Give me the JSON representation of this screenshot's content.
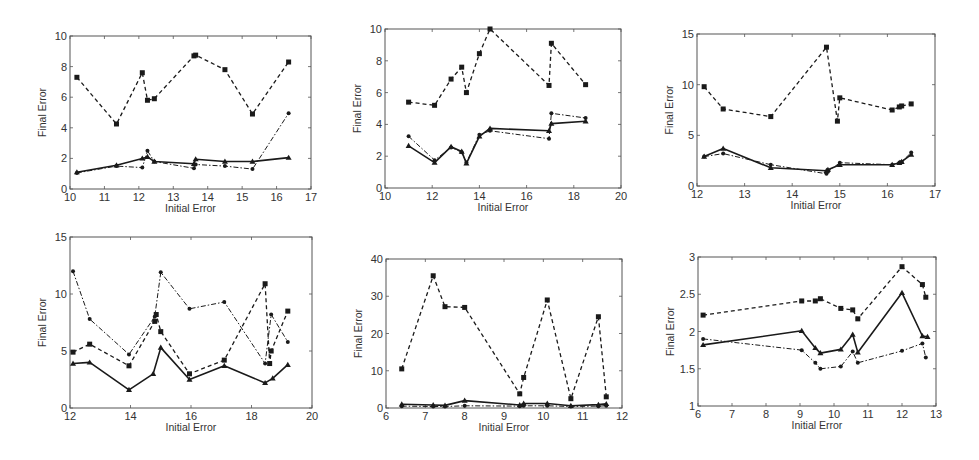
{
  "chart_data": [
    {
      "type": "line",
      "panel": "top-left",
      "title": "",
      "xlabel": "Initial Error",
      "ylabel": "Final Error",
      "xlim": [
        10,
        17
      ],
      "ylim": [
        0,
        10
      ],
      "xticks": [
        10,
        11,
        12,
        13,
        14,
        15,
        16,
        17
      ],
      "yticks": [
        0,
        2,
        4,
        6,
        8,
        10
      ],
      "grid": false,
      "box": {
        "left": 70,
        "top": 36,
        "right": 311,
        "bottom": 189
      },
      "series": [
        {
          "name": "dashed-squares",
          "style": "dashed",
          "marker": "square",
          "x": [
            10.2,
            11.35,
            12.1,
            12.25,
            12.45,
            13.6,
            13.65,
            14.5,
            15.3,
            16.35
          ],
          "y": [
            7.3,
            4.25,
            7.6,
            5.8,
            5.9,
            8.7,
            8.75,
            7.8,
            4.9,
            8.3
          ]
        },
        {
          "name": "solid-triangles",
          "style": "solid",
          "marker": "triangle",
          "x": [
            10.2,
            11.35,
            12.1,
            12.25,
            12.45,
            13.6,
            13.65,
            14.5,
            15.3,
            16.35
          ],
          "y": [
            1.1,
            1.55,
            2.0,
            2.1,
            1.8,
            1.65,
            1.95,
            1.8,
            1.8,
            2.05
          ]
        },
        {
          "name": "dashdot-dots",
          "style": "dashdot",
          "marker": "dot",
          "x": [
            10.2,
            11.35,
            12.1,
            12.25,
            12.45,
            13.6,
            13.65,
            14.5,
            15.3,
            16.35
          ],
          "y": [
            1.05,
            1.5,
            1.4,
            2.5,
            1.8,
            1.35,
            1.6,
            1.5,
            1.3,
            4.95
          ]
        }
      ]
    },
    {
      "type": "line",
      "panel": "top-middle",
      "title": "",
      "xlabel": "Initial Error",
      "ylabel": "Final Error",
      "xlim": [
        10,
        20
      ],
      "ylim": [
        0,
        10
      ],
      "xticks": [
        10,
        12,
        14,
        16,
        18,
        20
      ],
      "yticks": [
        0,
        2,
        4,
        6,
        8,
        10
      ],
      "grid": false,
      "box": {
        "left": 385,
        "top": 29,
        "right": 621,
        "bottom": 188
      },
      "series": [
        {
          "name": "dashed-squares",
          "style": "dashed",
          "marker": "square",
          "x": [
            11.0,
            12.1,
            12.8,
            13.25,
            13.45,
            14.0,
            14.45,
            16.95,
            17.05,
            18.5
          ],
          "y": [
            5.4,
            5.2,
            6.85,
            7.6,
            6.0,
            8.45,
            10.0,
            6.45,
            9.1,
            6.5
          ]
        },
        {
          "name": "solid-triangles",
          "style": "solid",
          "marker": "triangle",
          "x": [
            11.0,
            12.1,
            12.8,
            13.25,
            13.45,
            14.0,
            14.45,
            16.95,
            17.05,
            18.5
          ],
          "y": [
            2.65,
            1.6,
            2.6,
            2.3,
            1.55,
            3.25,
            3.75,
            3.6,
            4.05,
            4.2
          ]
        },
        {
          "name": "dashdot-dots",
          "style": "dashdot",
          "marker": "dot",
          "x": [
            11.0,
            12.1,
            12.8,
            13.25,
            13.45,
            14.0,
            14.45,
            16.95,
            17.05,
            18.5
          ],
          "y": [
            3.25,
            1.75,
            2.55,
            2.25,
            1.6,
            3.35,
            3.6,
            3.1,
            4.7,
            4.4
          ]
        }
      ]
    },
    {
      "type": "line",
      "panel": "top-right",
      "title": "",
      "xlabel": "Initial Error",
      "ylabel": "Final Error",
      "xlim": [
        12,
        17
      ],
      "ylim": [
        0,
        15
      ],
      "xticks": [
        12,
        13,
        14,
        15,
        16,
        17
      ],
      "yticks": [
        0,
        5,
        10,
        15
      ],
      "grid": false,
      "box": {
        "left": 697,
        "top": 34,
        "right": 935,
        "bottom": 186
      },
      "series": [
        {
          "name": "dashed-squares",
          "style": "dashed",
          "marker": "square",
          "x": [
            12.15,
            12.55,
            13.55,
            14.72,
            14.95,
            15.0,
            16.1,
            16.25,
            16.3,
            16.5
          ],
          "y": [
            9.8,
            7.6,
            6.85,
            13.7,
            6.4,
            8.7,
            7.5,
            7.8,
            7.9,
            8.1
          ]
        },
        {
          "name": "solid-triangles",
          "style": "solid",
          "marker": "triangle",
          "x": [
            12.15,
            12.55,
            13.55,
            14.72,
            14.75,
            15.0,
            16.1,
            16.25,
            16.3,
            16.5
          ],
          "y": [
            2.9,
            3.7,
            1.8,
            1.5,
            1.6,
            2.1,
            2.1,
            2.3,
            2.4,
            3.1
          ]
        },
        {
          "name": "dashdot-dots",
          "style": "dashdot",
          "marker": "dot",
          "x": [
            12.15,
            12.55,
            13.55,
            14.72,
            14.75,
            15.0,
            16.1,
            16.25,
            16.3,
            16.5
          ],
          "y": [
            2.9,
            3.2,
            2.1,
            1.2,
            1.4,
            2.3,
            2.1,
            2.3,
            2.4,
            3.3
          ]
        }
      ]
    },
    {
      "type": "line",
      "panel": "bottom-left",
      "title": "",
      "xlabel": "Initial Error",
      "ylabel": "Final Error",
      "xlim": [
        12,
        20
      ],
      "ylim": [
        0,
        15
      ],
      "xticks": [
        12,
        14,
        16,
        18,
        20
      ],
      "yticks": [
        0,
        5,
        10,
        15
      ],
      "grid": false,
      "box": {
        "left": 70,
        "top": 237,
        "right": 312,
        "bottom": 408
      },
      "series": [
        {
          "name": "dashed-squares",
          "style": "dashed",
          "marker": "square",
          "x": [
            12.1,
            12.65,
            13.95,
            14.8,
            14.85,
            15.0,
            15.95,
            17.1,
            18.45,
            18.6,
            18.65,
            19.2
          ],
          "y": [
            4.9,
            5.6,
            3.7,
            7.6,
            8.2,
            6.7,
            3.0,
            4.2,
            10.9,
            3.9,
            5.0,
            8.5
          ]
        },
        {
          "name": "solid-triangles",
          "style": "solid",
          "marker": "triangle",
          "x": [
            12.1,
            12.65,
            13.95,
            14.75,
            15.0,
            15.95,
            17.1,
            18.45,
            18.7,
            19.2
          ],
          "y": [
            3.9,
            4.0,
            1.6,
            3.0,
            5.3,
            2.5,
            3.7,
            2.2,
            2.6,
            3.8
          ]
        },
        {
          "name": "dashdot-dots",
          "style": "dashdot",
          "marker": "dot",
          "x": [
            12.1,
            12.65,
            13.95,
            14.8,
            15.0,
            15.95,
            17.1,
            18.45,
            18.65,
            19.2
          ],
          "y": [
            12.0,
            7.8,
            4.7,
            8.0,
            11.9,
            8.7,
            9.3,
            3.9,
            8.2,
            5.8
          ]
        }
      ]
    },
    {
      "type": "line",
      "panel": "bottom-middle",
      "title": "",
      "xlabel": "Initial Error",
      "ylabel": "Final Error",
      "xlim": [
        6,
        12
      ],
      "ylim": [
        0,
        40
      ],
      "xticks": [
        6,
        7,
        8,
        9,
        10,
        11,
        12
      ],
      "yticks": [
        0,
        10,
        20,
        30,
        40
      ],
      "grid": false,
      "box": {
        "left": 386,
        "top": 259,
        "right": 622,
        "bottom": 408
      },
      "series": [
        {
          "name": "dashed-squares",
          "style": "dashed",
          "marker": "square",
          "x": [
            6.4,
            7.2,
            7.5,
            8.0,
            9.4,
            9.5,
            10.1,
            10.7,
            11.4,
            11.6
          ],
          "y": [
            10.5,
            35.5,
            27.2,
            27.0,
            3.8,
            8.2,
            29.0,
            2.5,
            24.5,
            3.0
          ]
        },
        {
          "name": "solid-triangles",
          "style": "solid",
          "marker": "triangle",
          "x": [
            6.4,
            7.2,
            7.5,
            8.0,
            9.4,
            9.5,
            10.1,
            10.7,
            11.4,
            11.6
          ],
          "y": [
            1.0,
            0.8,
            0.7,
            2.0,
            0.8,
            1.2,
            1.2,
            0.6,
            0.9,
            1.1
          ]
        },
        {
          "name": "dashdot-dots",
          "style": "dashdot",
          "marker": "dot",
          "x": [
            6.4,
            7.2,
            7.5,
            8.0,
            9.4,
            9.5,
            10.1,
            10.7,
            11.4,
            11.6
          ],
          "y": [
            0.5,
            0.4,
            0.4,
            0.6,
            0.5,
            0.6,
            0.6,
            0.4,
            0.5,
            0.6
          ]
        }
      ]
    },
    {
      "type": "line",
      "panel": "bottom-right",
      "title": "",
      "xlabel": "Initial Error",
      "ylabel": "Final Error",
      "xlim": [
        6,
        13
      ],
      "ylim": [
        1,
        3
      ],
      "xticks": [
        6,
        7,
        8,
        9,
        10,
        11,
        12,
        13
      ],
      "yticks": [
        1,
        1.5,
        2,
        2.5,
        3
      ],
      "grid": false,
      "box": {
        "left": 698,
        "top": 257,
        "right": 936,
        "bottom": 406
      },
      "series": [
        {
          "name": "dashed-squares",
          "style": "dashed",
          "marker": "square",
          "x": [
            6.15,
            9.05,
            9.45,
            9.6,
            10.2,
            10.55,
            10.7,
            12.0,
            12.6,
            12.7
          ],
          "y": [
            2.22,
            2.41,
            2.41,
            2.44,
            2.31,
            2.29,
            2.17,
            2.87,
            2.63,
            2.46
          ]
        },
        {
          "name": "solid-triangles",
          "style": "solid",
          "marker": "triangle",
          "x": [
            6.15,
            9.05,
            9.45,
            9.6,
            10.2,
            10.55,
            10.7,
            12.0,
            12.6,
            12.75
          ],
          "y": [
            1.82,
            2.01,
            1.78,
            1.71,
            1.76,
            1.96,
            1.72,
            2.52,
            1.94,
            1.93
          ]
        },
        {
          "name": "dashdot-dots",
          "style": "dashdot",
          "marker": "dot",
          "x": [
            6.15,
            9.05,
            9.45,
            9.6,
            10.2,
            10.55,
            10.7,
            12.0,
            12.6,
            12.7
          ],
          "y": [
            1.9,
            1.75,
            1.58,
            1.5,
            1.53,
            1.73,
            1.58,
            1.74,
            1.84,
            1.65
          ]
        }
      ]
    }
  ],
  "style": {
    "line_color": "#1a1a1a",
    "axis_color": "#555555",
    "background": "#ffffff"
  }
}
